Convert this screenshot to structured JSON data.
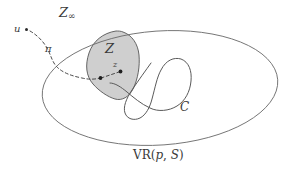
{
  "figure": {
    "type": "mathematical-diagram",
    "background_color": "#ffffff",
    "stroke_color": "#555555",
    "dashed_stroke_color": "#4a4a4a",
    "shade_fill_color": "#cccccc",
    "shade_stroke_color": "#555555",
    "text_color": "#3a3a3a"
  },
  "labels": {
    "z_infinity": {
      "base": "Z",
      "subscript": "∞",
      "full": "Z∞"
    },
    "u": "u",
    "pi": "π",
    "z_region": "Z",
    "z_point": "z",
    "curve_c": "C",
    "voronoi_region": {
      "function": "VR",
      "open_paren": "(",
      "arg1": "p",
      "comma": ", ",
      "arg2": "S",
      "close_paren": ")",
      "full": "VR(p, S)"
    }
  },
  "shapes": {
    "outer_ellipse": {
      "name": "voronoi-region-boundary",
      "cx": 160,
      "cy": 88,
      "rx": 118,
      "ry": 57,
      "rotation_deg": -4
    },
    "shaded_blob": {
      "name": "zone-z",
      "fill": "#cccccc"
    },
    "curve_c": {
      "name": "curve-c",
      "self_intersecting": true
    },
    "dashed_path": {
      "name": "path-pi",
      "from": "u",
      "to": "z"
    },
    "points": [
      {
        "name": "point-u",
        "x": 26,
        "y": 29
      },
      {
        "name": "point-z",
        "x": 121,
        "y": 72
      },
      {
        "name": "point-pi-endpoint",
        "x": 101,
        "y": 78
      }
    ]
  }
}
